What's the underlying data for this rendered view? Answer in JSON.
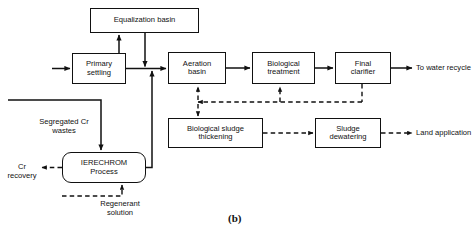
{
  "figure": {
    "caption": "(b)",
    "type": "process-flow-diagram"
  },
  "nodes": [
    {
      "id": "equalization-basin",
      "label": "Equalization basin",
      "x": 90,
      "y": 8,
      "w": 109,
      "h": 25,
      "shape": "rect"
    },
    {
      "id": "primary-settling",
      "label": "Primary\nsettling",
      "x": 72,
      "y": 53,
      "w": 54,
      "h": 31,
      "shape": "rect"
    },
    {
      "id": "aeration-basin",
      "label": "Aeration\nbasin",
      "x": 168,
      "y": 52,
      "w": 58,
      "h": 32,
      "shape": "rect"
    },
    {
      "id": "biological-treatment",
      "label": "Biological\ntreatment",
      "x": 252,
      "y": 52,
      "w": 63,
      "h": 32,
      "shape": "rect"
    },
    {
      "id": "final-clarifier",
      "label": "Final\nclarifier",
      "x": 335,
      "y": 52,
      "w": 56,
      "h": 32,
      "shape": "rect"
    },
    {
      "id": "biological-sludge-thickening",
      "label": "Biological sludge\nthickening",
      "x": 168,
      "y": 118,
      "w": 95,
      "h": 30,
      "shape": "rect"
    },
    {
      "id": "sludge-dewatering",
      "label": "Sludge\ndewatering",
      "x": 315,
      "y": 118,
      "w": 66,
      "h": 30,
      "shape": "rect"
    },
    {
      "id": "ierechrom-process",
      "label": "IERECHROM\nProcess",
      "x": 62,
      "y": 152,
      "w": 84,
      "h": 31,
      "shape": "rounded"
    }
  ],
  "labels": [
    {
      "id": "segregated-cr-wastes",
      "text": "Segregated Cr\nwastes",
      "x": 26,
      "y": 118,
      "w": 76,
      "align": "center"
    },
    {
      "id": "cr-recovery",
      "text": "Cr\nrecovery",
      "x": 2,
      "y": 163,
      "w": 40,
      "align": "center"
    },
    {
      "id": "regenerant-solution",
      "text": "Regenerant\nsolution",
      "x": 82,
      "y": 200,
      "w": 76,
      "align": "center"
    },
    {
      "id": "to-water-recycle",
      "text": "To water recycle",
      "x": 416,
      "y": 64,
      "w": 60,
      "align": "left"
    },
    {
      "id": "land-application",
      "text": "Land application",
      "x": 416,
      "y": 129,
      "w": 60,
      "align": "left"
    }
  ],
  "flows": {
    "solid_streams": [
      "influent-to-primary-settling",
      "primary-settling-to-equalization-basin",
      "equalization-basin-to-junction",
      "junction-to-aeration-basin",
      "aeration-basin-to-biological-treatment",
      "biological-treatment-to-final-clarifier",
      "final-clarifier-to-water-recycle",
      "segregated-cr-wastes-to-ierechrom-process",
      "ierechrom-process-to-junction",
      "final-clarifier-to-biological-sludge-thickening"
    ],
    "dashed_streams": [
      "final-clarifier-sludge-return",
      "return-to-aeration-basin",
      "return-to-biological-treatment",
      "thickening-to-sludge-dewatering",
      "sludge-dewatering-to-land-application",
      "ierechrom-process-to-cr-recovery",
      "regenerant-solution-to-ierechrom-process"
    ]
  },
  "style": {
    "line_color": "#111111",
    "box_fill": "#ffffff",
    "background": "#ffffff"
  }
}
